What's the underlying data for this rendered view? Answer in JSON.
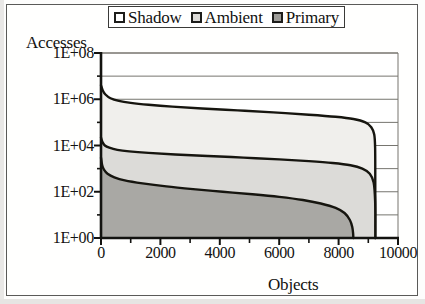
{
  "chart_data": {
    "type": "area",
    "title": "",
    "subtitle": "",
    "xlabel": "Objects",
    "ylabel": "Accesses",
    "yscale": "log",
    "ylim": [
      1,
      100000000
    ],
    "xlim": [
      0,
      10000
    ],
    "grid": true,
    "legend_position": "top",
    "y_tick_labels": [
      "1E+00",
      "1E+02",
      "1E+04",
      "1E+06",
      "1E+08"
    ],
    "y_tick_values": [
      1,
      100,
      10000,
      1000000,
      100000000
    ],
    "x_tick_labels": [
      "0",
      "2000",
      "4000",
      "6000",
      "8000",
      "10000"
    ],
    "x_tick_values": [
      0,
      2000,
      4000,
      6000,
      8000,
      10000
    ],
    "x_minor_tick_step": 1000,
    "stacking": "overlaid-bands",
    "series": [
      {
        "name": "Shadow",
        "swatch_color": "#ffffff",
        "fill_color": "#f0efec",
        "line_color": "#16150f",
        "x": [
          0,
          60,
          150,
          320,
          600,
          1000,
          1600,
          2400,
          3400,
          4600,
          5800,
          7000,
          7900,
          8500,
          8900,
          9100,
          9200,
          9230,
          9235,
          9235
        ],
        "y": [
          4000000,
          2400000,
          1600000,
          1100000,
          850000,
          700000,
          580000,
          480000,
          400000,
          330000,
          270000,
          215000,
          175000,
          140000,
          100000,
          62000,
          30000,
          8000,
          300,
          1
        ]
      },
      {
        "name": "Ambient",
        "swatch_color": "#dcdbd8",
        "fill_color": "#dcdbd8",
        "line_color": "#16150f",
        "x": [
          0,
          50,
          130,
          280,
          550,
          950,
          1600,
          2500,
          3600,
          4800,
          6000,
          7000,
          7800,
          8400,
          8800,
          9050,
          9180,
          9230,
          9235,
          9235
        ],
        "y": [
          22000,
          14000,
          10000,
          8000,
          6500,
          5600,
          4800,
          4100,
          3500,
          3000,
          2500,
          2100,
          1750,
          1400,
          1000,
          600,
          250,
          40,
          3,
          1
        ]
      },
      {
        "name": "Primary",
        "swatch_color": "#9d9c98",
        "fill_color": "#a9a8a4",
        "line_color": "#16150f",
        "x": [
          0,
          40,
          100,
          220,
          450,
          800,
          1400,
          2200,
          3100,
          4100,
          5100,
          6000,
          6800,
          7400,
          7900,
          8200,
          8380,
          8460,
          8490,
          8495
        ],
        "y": [
          3000,
          1400,
          900,
          600,
          420,
          310,
          230,
          170,
          130,
          100,
          78,
          60,
          44,
          31,
          20,
          12,
          6,
          3,
          1.5,
          1
        ]
      }
    ]
  },
  "legend": {
    "items": [
      {
        "label": "Shadow"
      },
      {
        "label": "Ambient"
      },
      {
        "label": "Primary"
      }
    ]
  },
  "axes": {
    "y_title": "Accesses",
    "x_title": "Objects"
  }
}
